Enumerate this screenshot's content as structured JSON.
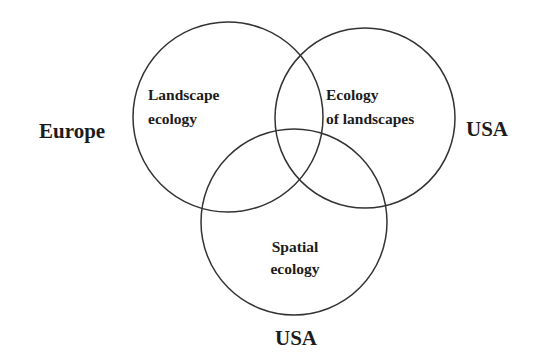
{
  "diagram": {
    "type": "venn",
    "stroke_color": "#333333",
    "text_color": "#1c1c1c",
    "circles": [
      {
        "id": "landscape-ecology",
        "cx": 228,
        "cy": 117,
        "r": 95,
        "label_lines": [
          "Landscape",
          "ecology"
        ],
        "region": "Europe"
      },
      {
        "id": "ecology-of-landscapes",
        "cx": 365,
        "cy": 118,
        "r": 90,
        "label_lines": [
          "Ecology",
          "of landscapes"
        ],
        "region": "USA"
      },
      {
        "id": "spatial-ecology",
        "cx": 294,
        "cy": 222,
        "r": 93,
        "label_lines": [
          "Spatial",
          "ecology"
        ],
        "region": "USA"
      }
    ],
    "outer_labels": {
      "left": "Europe",
      "right": "USA",
      "bottom": "USA"
    }
  }
}
